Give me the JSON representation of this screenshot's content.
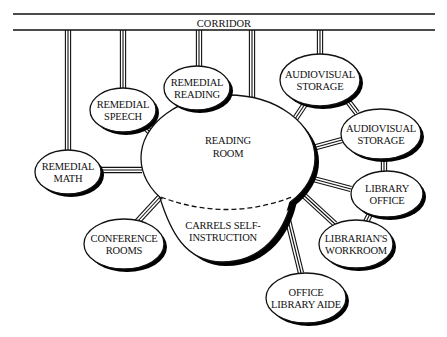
{
  "corridor": {
    "label": "CORRIDOR",
    "y_top": 14,
    "y_bottom": 30,
    "x_left": 13,
    "x_right": 435
  },
  "center": {
    "id": "reading-room",
    "lines": [
      "READING",
      "ROOM"
    ],
    "cx": 228,
    "cy": 158,
    "rx": 87,
    "ry": 63
  },
  "carrels": {
    "id": "carrels-self-instruction",
    "lines": [
      "CARRELS SELF-",
      "INSTRUCTION"
    ],
    "dashed_divider": true
  },
  "nodes": [
    {
      "id": "remedial-math",
      "lines": [
        "REMEDIAL",
        "MATH"
      ],
      "cx": 68,
      "cy": 172,
      "rx": 33,
      "ry": 22
    },
    {
      "id": "remedial-speech",
      "lines": [
        "REMEDIAL",
        "SPEECH"
      ],
      "cx": 123,
      "cy": 110,
      "rx": 33,
      "ry": 22
    },
    {
      "id": "remedial-reading",
      "lines": [
        "REMEDIAL",
        "READING"
      ],
      "cx": 197,
      "cy": 88,
      "rx": 33,
      "ry": 22
    },
    {
      "id": "audiovisual-storage-1",
      "lines": [
        "AUDIOVISUAL",
        "STORAGE"
      ],
      "cx": 320,
      "cy": 80,
      "rx": 40,
      "ry": 26
    },
    {
      "id": "audiovisual-storage-2",
      "lines": [
        "AUDIOVISUAL",
        "STORAGE"
      ],
      "cx": 381,
      "cy": 134,
      "rx": 40,
      "ry": 25
    },
    {
      "id": "library-office",
      "lines": [
        "LIBRARY",
        "OFFICE"
      ],
      "cx": 387,
      "cy": 194,
      "rx": 36,
      "ry": 23
    },
    {
      "id": "librarians-workroom",
      "lines": [
        "LIBRARIAN'S",
        "WORKROOM"
      ],
      "cx": 356,
      "cy": 244,
      "rx": 37,
      "ry": 24
    },
    {
      "id": "office-library-aide",
      "lines": [
        "OFFICE",
        "LIBRARY AIDE"
      ],
      "cx": 306,
      "cy": 298,
      "rx": 40,
      "ry": 25
    },
    {
      "id": "conference-rooms",
      "lines": [
        "CONFERENCE",
        "ROOMS"
      ],
      "cx": 124,
      "cy": 244,
      "rx": 40,
      "ry": 25
    }
  ],
  "connections": [
    {
      "from": "corridor",
      "to": "remedial-math",
      "x1": 68,
      "y1": 30,
      "x2": 68,
      "y2": 150
    },
    {
      "from": "corridor",
      "to": "remedial-speech",
      "x1": 123,
      "y1": 30,
      "x2": 123,
      "y2": 88
    },
    {
      "from": "corridor",
      "to": "remedial-reading",
      "x1": 199,
      "y1": 30,
      "x2": 199,
      "y2": 66
    },
    {
      "from": "corridor",
      "to": "reading-room",
      "x1": 252,
      "y1": 30,
      "x2": 252,
      "y2": 99
    },
    {
      "from": "corridor",
      "to": "audiovisual-storage-1",
      "x1": 320,
      "y1": 30,
      "x2": 320,
      "y2": 54
    },
    {
      "from": "remedial-math",
      "to": "reading-room",
      "x1": 101,
      "y1": 170,
      "x2": 142,
      "y2": 170
    },
    {
      "from": "remedial-speech",
      "to": "reading-room",
      "x1": 145,
      "y1": 127,
      "x2": 156,
      "y2": 138
    },
    {
      "from": "remedial-reading",
      "to": "reading-room",
      "x1": 199,
      "y1": 110,
      "x2": 199,
      "y2": 98
    },
    {
      "from": "audiovisual-storage-1",
      "to": "reading-room",
      "x1": 305,
      "y1": 104,
      "x2": 285,
      "y2": 134
    },
    {
      "from": "audiovisual-storage-1",
      "to": "audiovisual-storage-2",
      "x1": 347,
      "y1": 100,
      "x2": 357,
      "y2": 113
    },
    {
      "from": "audiovisual-storage-2",
      "to": "reading-room",
      "x1": 342,
      "y1": 140,
      "x2": 298,
      "y2": 152
    },
    {
      "from": "audiovisual-storage-2",
      "to": "library-office",
      "x1": 384,
      "y1": 159,
      "x2": 384,
      "y2": 171
    },
    {
      "from": "library-office",
      "to": "reading-room",
      "x1": 351,
      "y1": 189,
      "x2": 302,
      "y2": 176
    },
    {
      "from": "library-office",
      "to": "librarians-workroom",
      "x1": 370,
      "y1": 214,
      "x2": 366,
      "y2": 222
    },
    {
      "from": "librarians-workroom",
      "to": "reading-room",
      "x1": 335,
      "y1": 224,
      "x2": 298,
      "y2": 190
    },
    {
      "from": "office-library-aide",
      "to": "reading-room",
      "x1": 301,
      "y1": 273,
      "x2": 283,
      "y2": 200
    },
    {
      "from": "conference-rooms",
      "to": "reading-room",
      "x1": 137,
      "y1": 222,
      "x2": 161,
      "y2": 196
    }
  ],
  "style": {
    "stroke": "#111111",
    "background": "#ffffff",
    "shadow": "#000000"
  }
}
